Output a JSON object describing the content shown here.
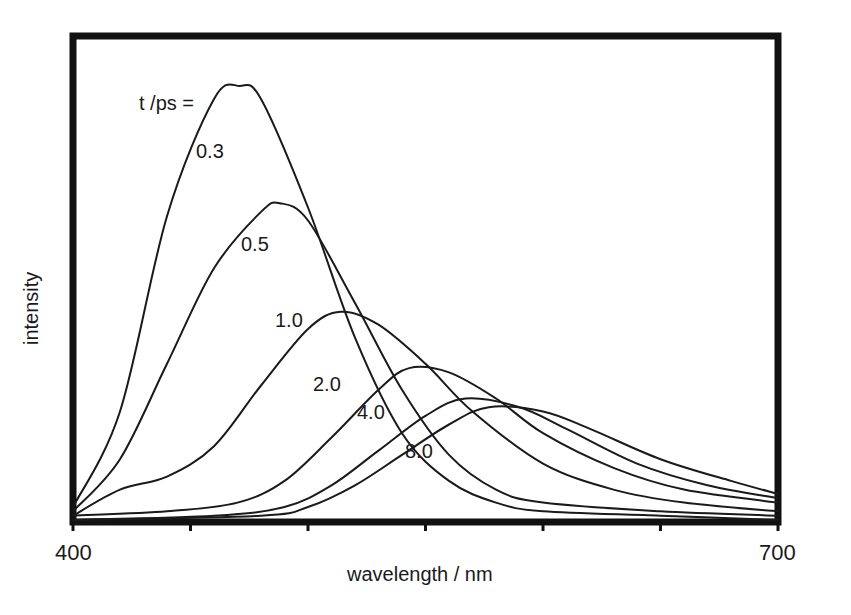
{
  "chart_data": {
    "type": "line",
    "title": "",
    "xlabel": "wavelength / nm",
    "ylabel": "intensity",
    "xlim": [
      400,
      700
    ],
    "ylim": [
      0,
      1.0
    ],
    "x_tick_labels": [
      "400",
      "700"
    ],
    "x_ticks": [
      400,
      450,
      500,
      550,
      600,
      650,
      700
    ],
    "grid": false,
    "legend_title": "t /ps =",
    "legend_position": "inline labels on curves",
    "y_units": "relative (arbitrary units, normalized to tallest peak)",
    "series": [
      {
        "name": "0.3",
        "peak_wavelength": 471,
        "peak_intensity": 1.0,
        "x": [
          400,
          420,
          440,
          460,
          471,
          480,
          500,
          520,
          540,
          560,
          580,
          600,
          650,
          700
        ],
        "values": [
          0.03,
          0.25,
          0.7,
          0.97,
          1.0,
          0.97,
          0.72,
          0.42,
          0.2,
          0.09,
          0.04,
          0.02,
          0.01,
          0.0
        ]
      },
      {
        "name": "0.5",
        "peak_wavelength": 488,
        "peak_intensity": 0.73,
        "x": [
          400,
          420,
          440,
          460,
          480,
          488,
          500,
          520,
          540,
          560,
          580,
          600,
          650,
          700
        ],
        "values": [
          0.02,
          0.14,
          0.36,
          0.58,
          0.71,
          0.73,
          0.69,
          0.5,
          0.3,
          0.15,
          0.07,
          0.04,
          0.02,
          0.01
        ]
      },
      {
        "name": "1.0",
        "peak_wavelength": 514,
        "peak_intensity": 0.48,
        "x": [
          400,
          420,
          440,
          460,
          480,
          500,
          514,
          530,
          550,
          570,
          600,
          630,
          660,
          700
        ],
        "values": [
          0.01,
          0.07,
          0.1,
          0.17,
          0.31,
          0.44,
          0.48,
          0.45,
          0.36,
          0.25,
          0.13,
          0.07,
          0.04,
          0.02
        ]
      },
      {
        "name": "2.0",
        "peak_wavelength": 543,
        "peak_intensity": 0.35,
        "x": [
          400,
          440,
          470,
          490,
          510,
          530,
          543,
          560,
          580,
          600,
          630,
          660,
          700
        ],
        "values": [
          0.01,
          0.02,
          0.04,
          0.09,
          0.19,
          0.3,
          0.35,
          0.34,
          0.28,
          0.2,
          0.12,
          0.07,
          0.04
        ]
      },
      {
        "name": "4.0",
        "peak_wavelength": 567,
        "peak_intensity": 0.28,
        "x": [
          400,
          460,
          490,
          510,
          530,
          550,
          567,
          590,
          610,
          640,
          670,
          700
        ],
        "values": [
          0.0,
          0.01,
          0.03,
          0.08,
          0.16,
          0.24,
          0.28,
          0.26,
          0.21,
          0.13,
          0.08,
          0.05
        ]
      },
      {
        "name": "8.0",
        "peak_wavelength": 577,
        "peak_intensity": 0.26,
        "x": [
          400,
          480,
          500,
          520,
          540,
          560,
          577,
          600,
          620,
          650,
          680,
          700
        ],
        "values": [
          0.0,
          0.01,
          0.03,
          0.08,
          0.15,
          0.22,
          0.26,
          0.25,
          0.21,
          0.14,
          0.09,
          0.06
        ]
      }
    ]
  },
  "labels": {
    "legend_title": "t /ps =",
    "x_min_label": "400",
    "x_max_label": "700",
    "xlabel": "wavelength / nm",
    "ylabel": "intensity",
    "curve_labels": [
      "0.3",
      "0.5",
      "1.0",
      "2.0",
      "4.0",
      "8.0"
    ]
  },
  "colors": {
    "line": "#1a1a1a",
    "frame": "#111111",
    "background": "#ffffff"
  }
}
